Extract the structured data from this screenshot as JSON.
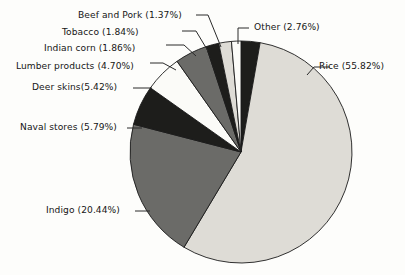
{
  "chart_data": {
    "type": "pie",
    "title": "",
    "subtitle": "",
    "xlabel": "",
    "ylabel": "",
    "grid": false,
    "legend_position": "none",
    "label_format": "name (percent%)",
    "start_angle_deg": 0,
    "direction": "clockwise",
    "total_percent": 100.0,
    "categories": [
      "Other",
      "Rice",
      "Indigo",
      "Naval stores",
      "Deer skins",
      "Lumber products",
      "Indian corn",
      "Tobacco",
      "Beef and Pork"
    ],
    "values": [
      2.76,
      55.82,
      20.44,
      5.79,
      5.42,
      4.7,
      1.86,
      1.84,
      1.37
    ],
    "slices": [
      {
        "name": "Other",
        "value": 2.76,
        "label": "Other (2.76%)",
        "percent_text": "2.76%",
        "fill": "#1d1d1b",
        "label_side": "right",
        "label_x": 254,
        "label_y": 23,
        "leader": "M 238 44 L 238 28 L 249 28"
      },
      {
        "name": "Rice",
        "value": 55.82,
        "label": "Rice (55.82%)",
        "percent_text": "55.82%",
        "fill": "#dedcd6",
        "label_side": "right",
        "label_x": 319,
        "label_y": 62,
        "leader": "M 307 75 L 314 67 L 330 67"
      },
      {
        "name": "Indigo",
        "value": 20.44,
        "label": "Indigo (20.44%)",
        "percent_text": "20.44%",
        "fill": "#6b6b68",
        "label_side": "left",
        "label_x": 46,
        "label_y": 206,
        "leader": "M 150 211 L 135 211"
      },
      {
        "name": "Naval stores",
        "value": 5.79,
        "label": "Naval stores (5.79%)",
        "percent_text": "5.79%",
        "fill": "#1d1d1b",
        "label_side": "left",
        "label_x": 20,
        "label_y": 123,
        "leader": "M 142 128 L 127 128"
      },
      {
        "name": "Deer skins",
        "value": 5.42,
        "label": "Deer skins(5.42%)",
        "percent_text": "5.42%",
        "fill": "#fbfbf8",
        "label_side": "left",
        "label_x": 32,
        "label_y": 83,
        "leader": "M 152 88 L 141 88 L 133 88"
      },
      {
        "name": "Lumber products",
        "value": 4.7,
        "label": "Lumber products (4.70%)",
        "percent_text": "4.70%",
        "fill": "#6b6b68",
        "label_side": "left",
        "label_x": 16,
        "label_y": 62,
        "leader": "M 176 70 L 163 63 L 150 63"
      },
      {
        "name": "Indian corn",
        "value": 1.86,
        "label": "Indian corn (1.86%)",
        "percent_text": "1.86%",
        "fill": "#1d1d1b",
        "label_side": "left",
        "label_x": 44,
        "label_y": 44,
        "leader": "M 196 56 L 184 45 L 166 45"
      },
      {
        "name": "Tobacco",
        "value": 1.84,
        "label": "Tobacco (1.84%)",
        "percent_text": "1.84%",
        "fill": "#dedcd6",
        "label_side": "left",
        "label_x": 62,
        "label_y": 28,
        "leader": "M 208 51 L 196 31 L 182 31"
      },
      {
        "name": "Beef and Pork",
        "value": 1.37,
        "label": "Beef and Pork (1.37%)",
        "percent_text": "1.37%",
        "fill": "#fbfbf8",
        "label_side": "left",
        "label_x": 78,
        "label_y": 11,
        "leader": "M 221 47 L 208 15 L 196 15"
      }
    ],
    "geometry": {
      "center_x": 241,
      "center_y": 152,
      "radius": 111
    },
    "colors": {
      "background": "#fdfdfb",
      "outline": "#1b1b1b",
      "text": "#161616",
      "black_fill": "#1d1d1b",
      "dark_gray_fill": "#6b6b68",
      "light_gray_fill": "#dedcd6",
      "white_fill": "#fbfbf8"
    }
  }
}
